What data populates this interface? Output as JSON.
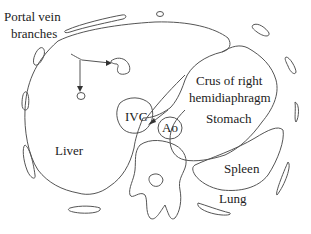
{
  "diagram": {
    "type": "anatomical cross-section (upper abdomen, axial)",
    "labels": {
      "portal_vein_line1": "Portal vein",
      "portal_vein_line2": "branches",
      "crus_line1": "Crus of right",
      "crus_line2": "hemidiaphragm",
      "liver": "Liver",
      "ivc": "IVC",
      "ao": "Ao",
      "stomach": "Stomach",
      "spleen": "Spleen",
      "lung": "Lung"
    },
    "colors": {
      "stroke": "#555555",
      "text": "#222222",
      "background": "#ffffff"
    }
  }
}
